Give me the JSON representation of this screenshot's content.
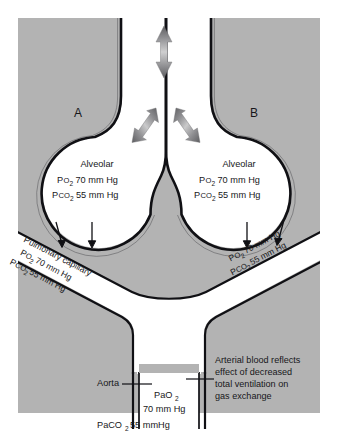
{
  "figure": {
    "background_color": "#b3b3b3",
    "vessel_fill": "#ffffff",
    "outline_color": "#101014",
    "text_color": "#17171a",
    "arrow_color": "#6b6b6e"
  },
  "markers": {
    "alveolus_a": "A",
    "alveolus_b": "B"
  },
  "alveolus_a": {
    "title": "Alveolar",
    "po2_label": "P",
    "po2_sub": "O",
    "po2_sub2": "2",
    "po2_value": "70 mm Hg",
    "pco2_label": "P",
    "pco2_sub": "CO",
    "pco2_sub2": "2",
    "pco2_value": "55 mm Hg",
    "line1": "Alveolar",
    "line2": "PO2 70 mm Hg",
    "line3": "PCO2 55 mm Hg"
  },
  "alveolus_b": {
    "title": "Alveolar",
    "po2_value": "70 mm Hg",
    "pco2_value": "55 mm Hg",
    "line1": "Alveolar",
    "line2": "PO2 70 mm Hg",
    "line3": "PCO2 55 mm Hg"
  },
  "capillary_left": {
    "name": "Pulmonary capillary",
    "po2_value": "70 mm Hg",
    "pco2_value": "55 mm Hg"
  },
  "capillary_right": {
    "po2_value": "70 mm Hg",
    "pco2_value": "55 mm Hg"
  },
  "aorta": {
    "label": "Aorta",
    "pao2_line1": "PaO",
    "pao2_sub": "2",
    "pao2_line2": "70 mm Hg",
    "paco2_label": "PaCO",
    "paco2_sub": "2",
    "paco2_value": "55 mmHg"
  },
  "annotation": {
    "line1": "Arterial blood reflects",
    "line2": "effect of decreased",
    "line3": "total ventilation on",
    "line4": "gas exchange"
  },
  "icons": {
    "airflow_arrow": "double-headed-arrow-vertical",
    "branch_arrow_left": "double-headed-arrow-diagonal-left",
    "branch_arrow_right": "double-headed-arrow-diagonal-right",
    "diffusion_arrow": "arrow-down-thin"
  }
}
